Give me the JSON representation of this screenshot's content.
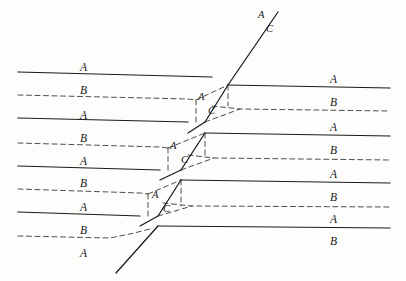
{
  "figure": {
    "kind": "geological-cross-section",
    "background_color": "#fdfdfc",
    "line_color": "#1a1a1a",
    "dashed_color": "#3a3a3a",
    "width": 406,
    "height": 281
  },
  "labels": {
    "left_beds": [
      {
        "text": "A",
        "x": 80,
        "y": 62
      },
      {
        "text": "B",
        "x": 80,
        "y": 85
      },
      {
        "text": "A",
        "x": 80,
        "y": 110
      },
      {
        "text": "B",
        "x": 80,
        "y": 133
      },
      {
        "text": "A",
        "x": 80,
        "y": 156
      },
      {
        "text": "B",
        "x": 80,
        "y": 178
      },
      {
        "text": "A",
        "x": 80,
        "y": 202
      },
      {
        "text": "B",
        "x": 80,
        "y": 225
      },
      {
        "text": "A",
        "x": 80,
        "y": 248
      }
    ],
    "right_beds": [
      {
        "text": "A",
        "x": 330,
        "y": 74
      },
      {
        "text": "B",
        "x": 330,
        "y": 97
      },
      {
        "text": "A",
        "x": 330,
        "y": 122
      },
      {
        "text": "B",
        "x": 330,
        "y": 145
      },
      {
        "text": "A",
        "x": 330,
        "y": 169
      },
      {
        "text": "B",
        "x": 330,
        "y": 192
      },
      {
        "text": "A",
        "x": 330,
        "y": 214
      },
      {
        "text": "B",
        "x": 330,
        "y": 236
      }
    ],
    "block_pairs": [
      {
        "a": "A",
        "ax": 198,
        "ay": 92,
        "c": "C",
        "cx": 208,
        "cy": 106
      },
      {
        "a": "A",
        "ax": 170,
        "ay": 141,
        "c": "C",
        "cx": 181,
        "cy": 155
      },
      {
        "a": "A",
        "ax": 152,
        "ay": 190,
        "c": "C",
        "cx": 163,
        "cy": 204
      }
    ],
    "fault_tip": [
      {
        "text": "A",
        "x": 258,
        "y": 10
      },
      {
        "text": "C",
        "x": 266,
        "y": 24
      }
    ]
  },
  "chart_data": {
    "type": "line",
    "title": "",
    "xlabel": "",
    "ylabel": "",
    "series": [
      {
        "name": "left-bed-A-1",
        "style": "solid",
        "points": [
          [
            18,
            72
          ],
          [
            212,
            77
          ]
        ]
      },
      {
        "name": "left-bed-B-1",
        "style": "dashed",
        "points": [
          [
            18,
            95
          ],
          [
            188,
            99
          ],
          [
            196,
            100
          ]
        ]
      },
      {
        "name": "left-bed-A-2",
        "style": "solid",
        "points": [
          [
            18,
            118
          ],
          [
            188,
            122
          ]
        ]
      },
      {
        "name": "left-bed-B-2",
        "style": "dashed",
        "points": [
          [
            18,
            143
          ],
          [
            160,
            147
          ],
          [
            168,
            148
          ]
        ]
      },
      {
        "name": "left-bed-A-3",
        "style": "solid",
        "points": [
          [
            18,
            166
          ],
          [
            160,
            170
          ]
        ]
      },
      {
        "name": "left-bed-B-3",
        "style": "dashed",
        "points": [
          [
            18,
            189
          ],
          [
            140,
            193
          ],
          [
            148,
            194
          ]
        ]
      },
      {
        "name": "left-bed-A-4",
        "style": "solid",
        "points": [
          [
            18,
            212
          ],
          [
            140,
            216
          ]
        ]
      },
      {
        "name": "left-bed-B-4",
        "style": "dashed",
        "points": [
          [
            18,
            236
          ],
          [
            110,
            238
          ],
          [
            130,
            234
          ],
          [
            150,
            229
          ]
        ]
      },
      {
        "name": "right-bed-A-1",
        "style": "solid",
        "points": [
          [
            228,
            85
          ],
          [
            390,
            88
          ]
        ]
      },
      {
        "name": "right-bed-B-1",
        "style": "dashed",
        "points": [
          [
            212,
            106
          ],
          [
            240,
            109
          ],
          [
            390,
            111
          ]
        ]
      },
      {
        "name": "right-bed-A-2",
        "style": "solid",
        "points": [
          [
            205,
            133
          ],
          [
            390,
            136
          ]
        ]
      },
      {
        "name": "right-bed-B-2",
        "style": "dashed",
        "points": [
          [
            188,
            155
          ],
          [
            214,
            158
          ],
          [
            390,
            160
          ]
        ]
      },
      {
        "name": "right-bed-A-3",
        "style": "solid",
        "points": [
          [
            181,
            180
          ],
          [
            390,
            183
          ]
        ]
      },
      {
        "name": "right-bed-B-3",
        "style": "dashed",
        "points": [
          [
            163,
            203
          ],
          [
            192,
            206
          ],
          [
            390,
            207
          ]
        ]
      },
      {
        "name": "right-bed-A-4",
        "style": "solid",
        "points": [
          [
            158,
            226
          ],
          [
            390,
            228
          ]
        ]
      },
      {
        "name": "fault-main-upper",
        "style": "solid",
        "points": [
          [
            278,
            12
          ],
          [
            228,
            85
          ]
        ]
      },
      {
        "name": "fault-seg-1",
        "style": "solid",
        "points": [
          [
            228,
            85
          ],
          [
            205,
            122
          ]
        ]
      },
      {
        "name": "fault-seg-1-lower",
        "style": "solid",
        "points": [
          [
            205,
            122
          ],
          [
            188,
            133
          ]
        ]
      },
      {
        "name": "fault-seg-2",
        "style": "solid",
        "points": [
          [
            205,
            133
          ],
          [
            181,
            170
          ]
        ]
      },
      {
        "name": "fault-seg-2-lower",
        "style": "solid",
        "points": [
          [
            181,
            170
          ],
          [
            160,
            180
          ]
        ]
      },
      {
        "name": "fault-seg-3",
        "style": "solid",
        "points": [
          [
            181,
            180
          ],
          [
            158,
            216
          ]
        ]
      },
      {
        "name": "fault-seg-3-lower",
        "style": "solid",
        "points": [
          [
            158,
            216
          ],
          [
            140,
            226
          ]
        ]
      },
      {
        "name": "fault-main-lower",
        "style": "solid",
        "points": [
          [
            158,
            226
          ],
          [
            116,
            273
          ]
        ]
      },
      {
        "name": "block-1-dashed",
        "style": "dashed",
        "points": [
          [
            196,
            100
          ],
          [
            228,
            85
          ]
        ]
      },
      {
        "name": "block-1-riser",
        "style": "dashed",
        "points": [
          [
            196,
            100
          ],
          [
            196,
            122
          ]
        ]
      },
      {
        "name": "block-1-right-riser",
        "style": "dashed",
        "points": [
          [
            228,
            85
          ],
          [
            228,
            106
          ]
        ]
      },
      {
        "name": "block-1-base",
        "style": "dashed",
        "points": [
          [
            205,
            122
          ],
          [
            240,
            109
          ]
        ]
      },
      {
        "name": "block-2-dashed",
        "style": "dashed",
        "points": [
          [
            168,
            148
          ],
          [
            205,
            133
          ]
        ]
      },
      {
        "name": "block-2-riser",
        "style": "dashed",
        "points": [
          [
            168,
            148
          ],
          [
            168,
            170
          ]
        ]
      },
      {
        "name": "block-2-right-riser",
        "style": "dashed",
        "points": [
          [
            205,
            133
          ],
          [
            205,
            158
          ]
        ]
      },
      {
        "name": "block-2-base",
        "style": "dashed",
        "points": [
          [
            181,
            170
          ],
          [
            214,
            158
          ]
        ]
      },
      {
        "name": "block-3-dashed",
        "style": "dashed",
        "points": [
          [
            148,
            194
          ],
          [
            181,
            180
          ]
        ]
      },
      {
        "name": "block-3-riser",
        "style": "dashed",
        "points": [
          [
            148,
            194
          ],
          [
            148,
            216
          ]
        ]
      },
      {
        "name": "block-3-right-riser",
        "style": "dashed",
        "points": [
          [
            181,
            180
          ],
          [
            181,
            206
          ]
        ]
      },
      {
        "name": "block-3-base",
        "style": "dashed",
        "points": [
          [
            158,
            216
          ],
          [
            192,
            206
          ]
        ]
      }
    ]
  }
}
